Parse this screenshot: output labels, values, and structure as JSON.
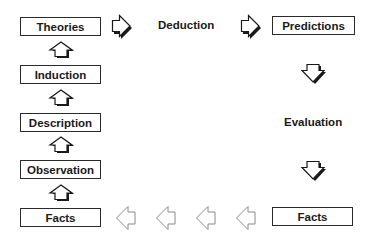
{
  "diagram": {
    "left_column": [
      {
        "label": "Theories"
      },
      {
        "label": "Induction"
      },
      {
        "label": "Description"
      },
      {
        "label": "Observation"
      },
      {
        "label": "Facts"
      }
    ],
    "right_column": {
      "top": {
        "label": "Predictions"
      },
      "bottom": {
        "label": "Facts"
      }
    },
    "process_labels": {
      "deduction": "Deduction",
      "evaluation": "Evaluation"
    },
    "arrows": {
      "up": [
        "Facts→Observation",
        "Observation→Description",
        "Description→Induction",
        "Induction→Theories"
      ],
      "right": [
        "Theories→Deduction",
        "Deduction→Predictions"
      ],
      "down": [
        "Predictions→Evaluation",
        "Evaluation→Facts"
      ],
      "left": [
        "Facts→Facts (1)",
        "Facts→Facts (2)",
        "Facts→Facts (3)",
        "Facts→Facts (4)"
      ]
    },
    "colors": {
      "box_border": "#2a2a2a",
      "text": "#1a1a1a",
      "arrow_outline": "#1a1a1a",
      "arrow_shadow": "#1a1a1a",
      "left_arrow_outline": "#8a8a8a"
    }
  }
}
